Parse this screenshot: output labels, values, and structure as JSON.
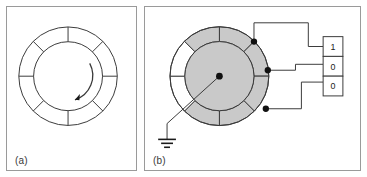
{
  "figure": {
    "background_color": "#ffffff",
    "frame_color": "#9a9a9a",
    "line_color": "#3a3a3a",
    "shaded_segment_color": "#c9c9c9",
    "unshaded_segment_color": "#ffffff",
    "contact_dot_color": "#111111"
  },
  "panels": [
    {
      "id": "a",
      "label": "(a)",
      "encoder": {
        "segment_count": 8,
        "segments_shaded": [
          false,
          false,
          false,
          false,
          false,
          false,
          false,
          false
        ],
        "inner_disc_shaded": false,
        "rotation_arrow": {
          "present": true,
          "direction": "counterclockwise"
        },
        "center_hub": false,
        "rotor_arm": false,
        "ground_symbol": false,
        "contacts": []
      }
    },
    {
      "id": "b",
      "label": "(b)",
      "encoder": {
        "segment_count": 8,
        "segments_shaded": [
          true,
          true,
          true,
          true,
          true,
          false,
          false,
          true
        ],
        "inner_disc_shaded": true,
        "rotation_arrow": {
          "present": false,
          "direction": ""
        },
        "center_hub": true,
        "rotor_arm": true,
        "ground_symbol": true,
        "contacts": [
          {
            "name": "contact-top",
            "wired_to_digit_index": 0
          },
          {
            "name": "contact-middle",
            "wired_to_digit_index": 1
          },
          {
            "name": "contact-bottom",
            "wired_to_digit_index": 2
          }
        ]
      },
      "digit_readout": {
        "cells": [
          "1",
          "0",
          "0"
        ]
      }
    }
  ]
}
